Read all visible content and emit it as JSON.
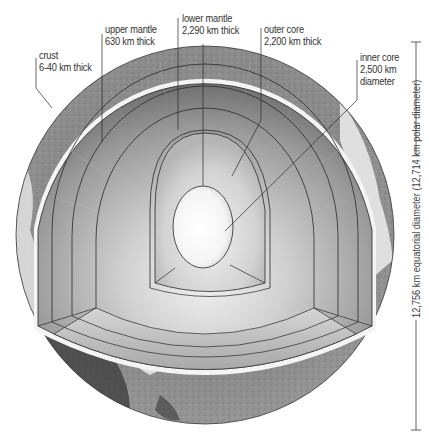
{
  "diagram": {
    "title": "",
    "labels": {
      "crust": {
        "name": "crust",
        "detail": "6-40 km thick"
      },
      "upper_mantle": {
        "name": "upper mantle",
        "detail": "630 km thick"
      },
      "lower_mantle": {
        "name": "lower mantle",
        "detail": "2,290 km thick"
      },
      "outer_core": {
        "name": "outer core",
        "detail": "2,200 km thick"
      },
      "inner_core": {
        "name": "inner core",
        "detail1": "2,500 km",
        "detail2": "diameter"
      }
    },
    "dimension": {
      "text": "12,756 km equatorial diameter (12,714 km polar diameter)"
    },
    "colors": {
      "background": "#ffffff",
      "line": "#2a2a2a",
      "crust_light": "#d8d8d8",
      "mantle_dark": "#6e6e6e",
      "mantle_light": "#c8c8c8",
      "core_light": "#f4f4f4",
      "surface_gray": "#8a8a8a"
    }
  }
}
